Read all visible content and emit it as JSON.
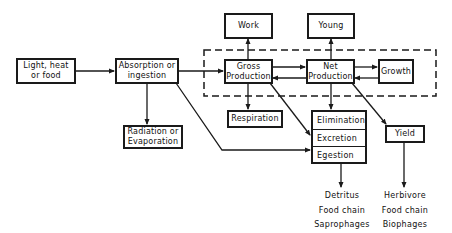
{
  "diagram": {
    "type": "flow-diagram",
    "nodes": {
      "light": "Light, heat\nor food",
      "absorption": "Absorption or\ningestion",
      "radiation": "Radiation or\nEvaporation",
      "gross": "Gross\nProduction",
      "work": "Work",
      "net": "Net\nProduction",
      "young": "Young",
      "growth": "Growth",
      "respiration": "Respiration",
      "elimination": "Elimination",
      "excretion": "Excretion",
      "egestion": "Egestion",
      "yield": "Yield"
    },
    "outputs": {
      "detritus": "Detritus\nFood chain\nSaprophages",
      "herbivore": "Herbivore\nFood chain\nBiophages"
    },
    "edges": [
      [
        "light",
        "absorption"
      ],
      [
        "absorption",
        "gross"
      ],
      [
        "absorption",
        "radiation"
      ],
      [
        "absorption",
        "egestion"
      ],
      [
        "gross",
        "work"
      ],
      [
        "gross",
        "net"
      ],
      [
        "net",
        "gross"
      ],
      [
        "gross",
        "respiration"
      ],
      [
        "gross",
        "excretion"
      ],
      [
        "net",
        "young"
      ],
      [
        "net",
        "growth"
      ],
      [
        "growth",
        "net"
      ],
      [
        "net",
        "elimination"
      ],
      [
        "net",
        "yield"
      ],
      [
        "elimination",
        "detritus"
      ],
      [
        "yield",
        "herbivore"
      ]
    ],
    "grouping": "dashed boundary enclosing Gross Production, Net Production and Growth",
    "colors": {
      "line": "#1a1a1a",
      "background": "#ffffff"
    }
  }
}
